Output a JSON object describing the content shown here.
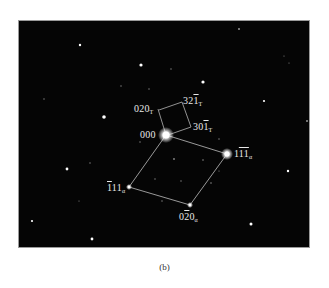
{
  "figure": {
    "caption": "(b)",
    "background_color": "#050505",
    "line_color": "#d8d8d8",
    "labels": {
      "origin": "000",
      "t_020": {
        "main": "020",
        "sub": "T"
      },
      "t_321": {
        "pre": "32",
        "bar": "1",
        "sub": "T"
      },
      "t_301": {
        "pre": "30",
        "bar": "1",
        "sub": "T"
      },
      "a_1m1m1": {
        "pre": "1",
        "bar": "11",
        "sub": "α"
      },
      "a_m111": {
        "bar": "1",
        "post": "11",
        "sub": "α"
      },
      "a_0m20": {
        "pre": "0",
        "bar": "2",
        "post": "0",
        "sub": "α"
      }
    }
  }
}
